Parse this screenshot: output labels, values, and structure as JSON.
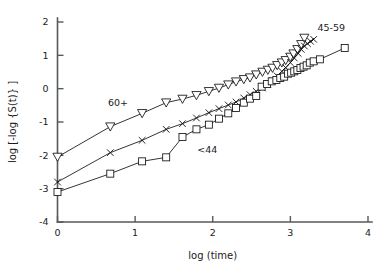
{
  "figure": {
    "background_color": "#ffffff",
    "line_color": "#111111",
    "axis_color": "#555a5c"
  },
  "axis_titles": {
    "x": "log (time)",
    "y": "log [-log {S(t)} ]"
  },
  "annotations": {
    "group_60plus": "60+",
    "group_45_59": "45-59",
    "group_under44": "<44"
  },
  "x_tick_labels": [
    "0",
    "1",
    "2",
    "3",
    "4"
  ],
  "y_tick_labels": [
    "2",
    "1",
    "0",
    "-1",
    "-2",
    "-3",
    "-4"
  ],
  "chart_data": {
    "type": "line",
    "title": "",
    "subtitle": "",
    "xlabel": "log (time)",
    "ylabel": "log [-log {S(t)} ]",
    "xlim": [
      0,
      4
    ],
    "ylim": [
      -4,
      2
    ],
    "xticks": [
      0,
      1,
      2,
      3,
      4
    ],
    "yticks": [
      -4,
      -3,
      -2,
      -1,
      0,
      1,
      2
    ],
    "grid": false,
    "legend": "inline-annotations",
    "annotations": [
      {
        "text": "60+",
        "x": 0.78,
        "y": -0.52
      },
      {
        "text": "45-59",
        "x": 3.35,
        "y": 1.72
      },
      {
        "text": "<44",
        "x": 1.93,
        "y": -1.93
      }
    ],
    "series": [
      {
        "name": "60+",
        "marker": "triangle-down",
        "points": [
          [
            0.0,
            -2.05
          ],
          [
            0.68,
            -1.14
          ],
          [
            1.09,
            -0.74
          ],
          [
            1.4,
            -0.42
          ],
          [
            1.61,
            -0.31
          ],
          [
            1.79,
            -0.2
          ],
          [
            1.95,
            -0.08
          ],
          [
            2.08,
            0.02
          ],
          [
            2.2,
            0.12
          ],
          [
            2.3,
            0.21
          ],
          [
            2.4,
            0.28
          ],
          [
            2.48,
            0.33
          ],
          [
            2.56,
            0.42
          ],
          [
            2.64,
            0.5
          ],
          [
            2.71,
            0.56
          ],
          [
            2.77,
            0.62
          ],
          [
            2.83,
            0.7
          ],
          [
            2.89,
            0.78
          ],
          [
            2.94,
            0.85
          ],
          [
            3.0,
            0.95
          ],
          [
            3.04,
            1.05
          ],
          [
            3.09,
            1.18
          ],
          [
            3.14,
            1.33
          ],
          [
            3.18,
            1.52
          ]
        ]
      },
      {
        "name": "45-59",
        "marker": "x",
        "points": [
          [
            0.0,
            -2.8
          ],
          [
            0.68,
            -1.92
          ],
          [
            1.09,
            -1.55
          ],
          [
            1.4,
            -1.22
          ],
          [
            1.61,
            -1.05
          ],
          [
            1.79,
            -0.88
          ],
          [
            1.95,
            -0.72
          ],
          [
            2.08,
            -0.6
          ],
          [
            2.2,
            -0.49
          ],
          [
            2.3,
            -0.4
          ],
          [
            2.4,
            -0.28
          ],
          [
            2.48,
            -0.18
          ],
          [
            2.56,
            -0.08
          ],
          [
            2.64,
            0.02
          ],
          [
            2.71,
            0.14
          ],
          [
            2.77,
            0.25
          ],
          [
            2.83,
            0.38
          ],
          [
            2.89,
            0.52
          ],
          [
            2.94,
            0.63
          ],
          [
            3.0,
            0.78
          ],
          [
            3.05,
            0.92
          ],
          [
            3.1,
            1.06
          ],
          [
            3.14,
            1.18
          ],
          [
            3.18,
            1.28
          ],
          [
            3.22,
            1.35
          ],
          [
            3.26,
            1.42
          ],
          [
            3.3,
            1.48
          ]
        ]
      },
      {
        "name": "<44",
        "marker": "square",
        "points": [
          [
            0.0,
            -3.1
          ],
          [
            0.68,
            -2.55
          ],
          [
            1.09,
            -2.18
          ],
          [
            1.4,
            -2.06
          ],
          [
            1.61,
            -1.45
          ],
          [
            1.79,
            -1.22
          ],
          [
            1.95,
            -1.08
          ],
          [
            2.08,
            -0.9
          ],
          [
            2.2,
            -0.74
          ],
          [
            2.3,
            -0.58
          ],
          [
            2.4,
            -0.42
          ],
          [
            2.48,
            -0.3
          ],
          [
            2.56,
            -0.22
          ],
          [
            2.63,
            0.06
          ],
          [
            2.7,
            0.14
          ],
          [
            2.76,
            0.22
          ],
          [
            2.82,
            0.26
          ],
          [
            2.87,
            0.32
          ],
          [
            2.92,
            0.36
          ],
          [
            2.97,
            0.45
          ],
          [
            3.01,
            0.48
          ],
          [
            3.05,
            0.52
          ],
          [
            3.09,
            0.56
          ],
          [
            3.13,
            0.62
          ],
          [
            3.17,
            0.66
          ],
          [
            3.21,
            0.7
          ],
          [
            3.25,
            0.78
          ],
          [
            3.3,
            0.82
          ],
          [
            3.38,
            0.88
          ],
          [
            3.7,
            1.22
          ]
        ]
      }
    ]
  }
}
